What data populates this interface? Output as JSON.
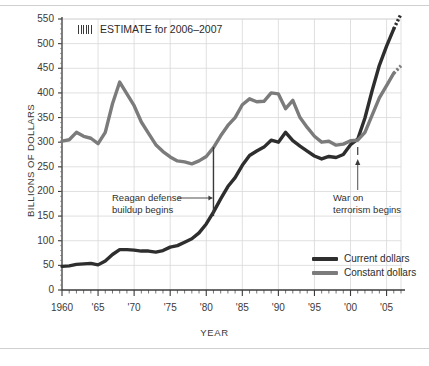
{
  "chart_data": {
    "type": "line",
    "title": "",
    "xlabel": "YEAR",
    "ylabel": "BILLIONS OF DOLLARS",
    "xlim": [
      1960,
      2007
    ],
    "ylim": [
      0,
      550
    ],
    "ytick_step": 50,
    "grid": true,
    "legend_position": "inside-bottom-right",
    "yticks": [
      "0",
      "50",
      "100",
      "150",
      "200",
      "250",
      "300",
      "350",
      "400",
      "450",
      "500",
      "550"
    ],
    "xticks": [
      "1960",
      "'65",
      "'70",
      "'75",
      "'80",
      "'85",
      "'90",
      "'95",
      "'00",
      "'05"
    ],
    "xtick_values": [
      1960,
      1965,
      1970,
      1975,
      1980,
      1985,
      1990,
      1995,
      2000,
      2005
    ],
    "x": [
      1960,
      1961,
      1962,
      1963,
      1964,
      1965,
      1966,
      1967,
      1968,
      1969,
      1970,
      1971,
      1972,
      1973,
      1974,
      1975,
      1976,
      1977,
      1978,
      1979,
      1980,
      1981,
      1982,
      1983,
      1984,
      1985,
      1986,
      1987,
      1988,
      1989,
      1990,
      1991,
      1992,
      1993,
      1994,
      1995,
      1996,
      1997,
      1998,
      1999,
      2000,
      2001,
      2002,
      2003,
      2004,
      2005,
      2006,
      2007
    ],
    "series": [
      {
        "name": "Current dollars",
        "color": "#2e2e2e",
        "values": [
          48,
          49,
          52,
          53,
          54,
          51,
          59,
          72,
          82,
          82,
          81,
          79,
          79,
          77,
          80,
          87,
          90,
          97,
          104,
          116,
          134,
          158,
          185,
          210,
          228,
          253,
          273,
          282,
          290,
          304,
          300,
          320,
          303,
          292,
          282,
          272,
          266,
          271,
          269,
          275,
          295,
          306,
          349,
          405,
          456,
          495,
          530,
          560
        ],
        "estimate_from": 2006
      },
      {
        "name": "Constant dollars",
        "color": "#7b7b7b",
        "values": [
          302,
          305,
          320,
          312,
          308,
          297,
          320,
          378,
          422,
          398,
          374,
          341,
          318,
          295,
          281,
          270,
          262,
          260,
          256,
          262,
          271,
          289,
          313,
          334,
          350,
          376,
          388,
          382,
          383,
          400,
          398,
          368,
          385,
          350,
          330,
          312,
          300,
          302,
          294,
          296,
          303,
          304,
          320,
          355,
          390,
          415,
          440,
          455
        ],
        "estimate_from": 2006
      }
    ],
    "annotations": [
      {
        "name": "reagan-buildup",
        "text_lines": [
          "Reagan defense",
          "buildup begins"
        ],
        "year": 1981,
        "marker": "vertical-line"
      },
      {
        "name": "war-on-terrorism",
        "text_lines": [
          "War on",
          "terrorism begins"
        ],
        "year": 2001,
        "marker": "arrow-up"
      }
    ],
    "estimate_note": {
      "label": "ESTIMATE for 2006–2007",
      "swatch": "hatched-pattern"
    }
  },
  "legend": {
    "items": [
      {
        "label": "Current dollars",
        "color": "#2e2e2e"
      },
      {
        "label": "Constant dollars",
        "color": "#7b7b7b"
      }
    ]
  }
}
